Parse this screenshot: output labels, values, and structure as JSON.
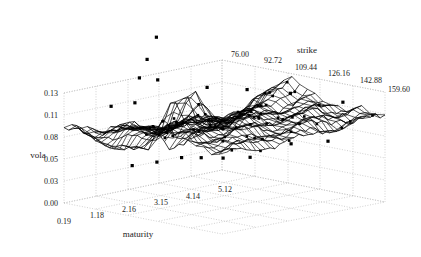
{
  "figure": {
    "title": "",
    "background_color": "#ffffff",
    "ink_color": "#000000",
    "grid_color": "#b9b9b9"
  },
  "axes": {
    "vola": {
      "label": "vola",
      "ticks": [
        "0.13",
        "0.11",
        "0.08",
        "0.05",
        "0.03",
        "0.00"
      ],
      "values": [
        0.13,
        0.11,
        0.08,
        0.05,
        0.03,
        0.0
      ]
    },
    "maturity": {
      "label": "maturity",
      "ticks": [
        "0.19",
        "1.18",
        "2.16",
        "3.15",
        "4.14",
        "5.12"
      ],
      "values": [
        0.19,
        1.18,
        2.16,
        3.15,
        4.14,
        5.12
      ]
    },
    "strike": {
      "label": "strike",
      "ticks": [
        "76.00",
        "92.72",
        "109.44",
        "126.16",
        "142.88",
        "159.60"
      ],
      "values": [
        76.0,
        92.72,
        109.44,
        126.16,
        142.88,
        159.6
      ]
    }
  },
  "chart_data": {
    "type": "surface",
    "title": "",
    "xlabel": "maturity",
    "ylabel": "strike",
    "zlabel": "vola",
    "grid": true,
    "legend": "none",
    "xlim": [
      0.19,
      5.12
    ],
    "ylim": [
      76.0,
      159.6
    ],
    "zlim": [
      0.0,
      0.13
    ],
    "x": [
      0.19,
      1.18,
      2.16,
      3.15,
      4.14,
      5.12
    ],
    "y": [
      76.0,
      92.72,
      109.44,
      126.16,
      142.88,
      159.6
    ],
    "surface_z": [
      [
        0.085,
        0.092,
        0.099,
        0.101,
        0.098,
        0.095
      ],
      [
        0.072,
        0.083,
        0.094,
        0.1,
        0.099,
        0.097
      ],
      [
        0.061,
        0.079,
        0.091,
        0.099,
        0.1,
        0.098
      ],
      [
        0.055,
        0.074,
        0.09,
        0.098,
        0.1,
        0.099
      ],
      [
        0.052,
        0.071,
        0.092,
        0.099,
        0.101,
        0.1
      ],
      [
        0.049,
        0.073,
        0.125,
        0.1,
        0.101,
        0.1
      ]
    ],
    "surface_note": "irregular dense wireframe mesh of implied volatility with a sharp spike near maturity 3.1 / low strike",
    "scatter_points": [
      {
        "maturity": 2.95,
        "strike": 78.0,
        "vola": 0.175
      },
      {
        "maturity": 2.6,
        "strike": 79.0,
        "vola": 0.152
      },
      {
        "maturity": 2.3,
        "strike": 80.0,
        "vola": 0.133
      },
      {
        "maturity": 2.75,
        "strike": 82.0,
        "vola": 0.128
      },
      {
        "maturity": 1.05,
        "strike": 86.0,
        "vola": 0.112
      },
      {
        "maturity": 1.55,
        "strike": 90.0,
        "vola": 0.114
      },
      {
        "maturity": 3.5,
        "strike": 95.0,
        "vola": 0.119
      },
      {
        "maturity": 4.2,
        "strike": 104.0,
        "vola": 0.115
      },
      {
        "maturity": 4.7,
        "strike": 118.0,
        "vola": 0.113
      },
      {
        "maturity": 5.0,
        "strike": 140.0,
        "vola": 0.11
      },
      {
        "maturity": 1.1,
        "strike": 96.0,
        "vola": 0.046
      },
      {
        "maturity": 1.75,
        "strike": 98.0,
        "vola": 0.046
      },
      {
        "maturity": 2.4,
        "strike": 100.0,
        "vola": 0.047
      },
      {
        "maturity": 2.95,
        "strike": 101.0,
        "vola": 0.043
      },
      {
        "maturity": 3.45,
        "strike": 104.0,
        "vola": 0.04
      },
      {
        "maturity": 4.05,
        "strike": 108.0,
        "vola": 0.038
      },
      {
        "maturity": 4.6,
        "strike": 120.0,
        "vola": 0.055
      },
      {
        "maturity": 4.9,
        "strike": 134.0,
        "vola": 0.062
      }
    ],
    "scatter_note": "observed market implied volatilities plotted as small black squares around the fitted surface"
  }
}
